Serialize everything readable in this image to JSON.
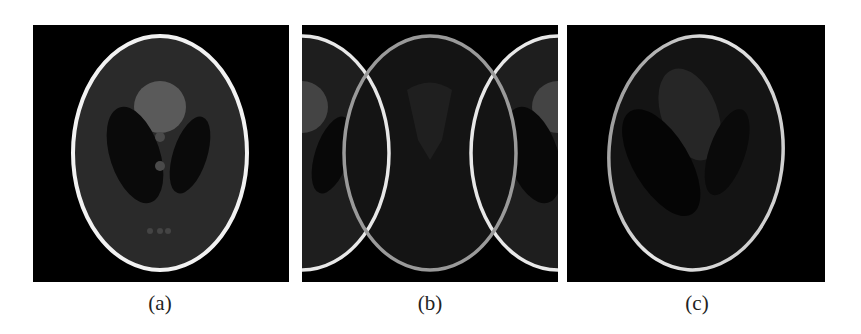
{
  "figure": {
    "panels": [
      {
        "id": "a",
        "caption": "(a)",
        "description": "Shepp-Logan phantom, original"
      },
      {
        "id": "b",
        "caption": "(b)",
        "description": "Reconstruction with wrap-around / aliasing artifacts"
      },
      {
        "id": "c",
        "caption": "(c)",
        "description": "Reconstruction with rotation and intensity loss"
      }
    ]
  },
  "colors": {
    "background": "#ffffff",
    "panel_bg": "#000000",
    "skull": "#f2f2f2",
    "brain": "#2a2a2a",
    "ventricle": "#0a0a0a",
    "blob": "#5a5a5a",
    "small_features": "#4a4a4a"
  }
}
